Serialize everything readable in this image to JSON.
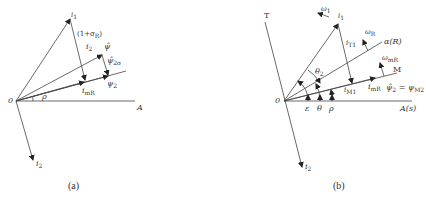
{
  "panel_a": {
    "caption": "(a)",
    "origin_label": "0",
    "axis_label": "A",
    "angle_label": "ρ",
    "vectors": {
      "i1": {
        "label": "i",
        "sub": "1"
      },
      "i2": {
        "label": "i",
        "sub": "2"
      },
      "psi": {
        "label": "ψ̂"
      },
      "psi2sigma": {
        "label": "ψ̂",
        "sub": "2σ"
      },
      "psi2": {
        "label": "ψ",
        "sub": "2"
      },
      "imR": {
        "label": "i",
        "sub": "mR"
      }
    },
    "coef_label": "(1+σ",
    "coef_sub": "R",
    "coef_close": ")",
    "coef_i2": "i",
    "coef_i2_sub": "2"
  },
  "panel_b": {
    "caption": "(b)",
    "origin_label": "0",
    "axis_label": "A(s)",
    "t_axis_label": "T",
    "alpha_label": "α(R)",
    "m_label": "M",
    "angles": {
      "epsilon": "ε",
      "theta": "θ",
      "rho": "ρ",
      "theta2": "θ",
      "theta2_sub": "2"
    },
    "vectors": {
      "i1": {
        "label": "i",
        "sub": "1"
      },
      "i2": {
        "label": "i",
        "sub": "2"
      },
      "iT1": {
        "label": "i",
        "sub": "T1"
      },
      "iM1": {
        "label": "i",
        "sub": "M1"
      },
      "imR": {
        "label": "i",
        "sub": "mR"
      }
    },
    "omega1": {
      "label": "ω",
      "sub": "1"
    },
    "omegaR": {
      "label": "ω",
      "sub": "R"
    },
    "omegamR": {
      "label": "ω",
      "sub": "mR"
    },
    "psi_eq": {
      "lhs": "ψ̂",
      "lhs_sub": "2",
      "eq": " = ψ",
      "rhs_sub": "M2"
    }
  }
}
